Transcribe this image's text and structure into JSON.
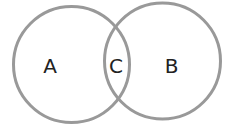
{
  "diagram": {
    "type": "venn",
    "stroke_color": "#999999",
    "text_color": "#222222",
    "sets": [
      {
        "id": "A",
        "label": "A",
        "cx": 71.5,
        "cy": 64.5,
        "r": 58
      },
      {
        "id": "B",
        "label": "B",
        "cx": 162.5,
        "cy": 61,
        "r": 58
      }
    ],
    "intersection": {
      "label": "C"
    }
  }
}
